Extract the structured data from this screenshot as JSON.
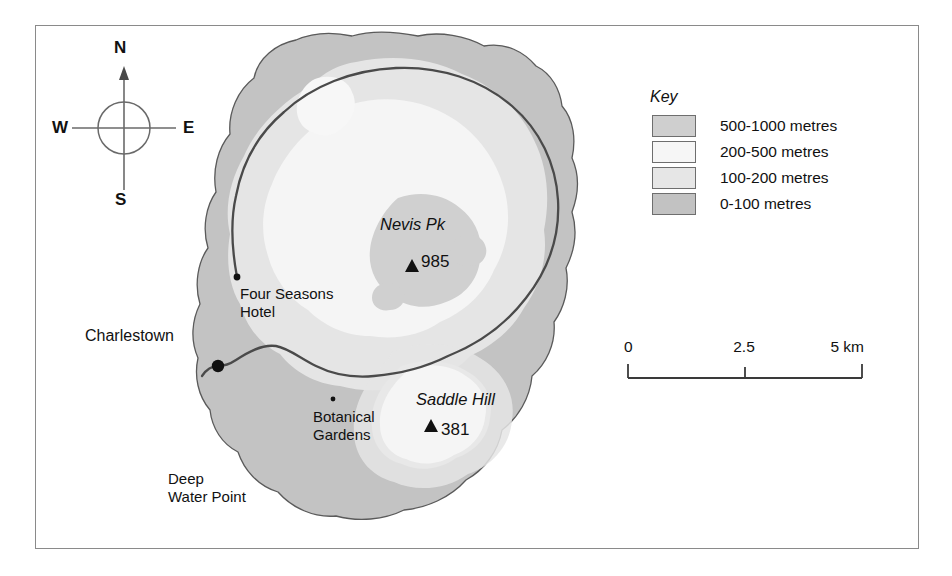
{
  "figure": {
    "kind": "physical-relief-map",
    "subject": "Nevis",
    "frame_color": "#8a8a8a",
    "background": "#ffffff"
  },
  "compass": {
    "name": "compass-rose",
    "north": "N",
    "south": "S",
    "east": "E",
    "west": "W"
  },
  "key": {
    "title": "Key",
    "entries": [
      {
        "label": "500-1000 metres",
        "color": "#cfcfcf"
      },
      {
        "label": "200-500 metres",
        "color": "#f4f4f4"
      },
      {
        "label": "100-200 metres",
        "color": "#e4e4e4"
      },
      {
        "label": "0-100 metres",
        "color": "#c2c2c2"
      }
    ]
  },
  "scale": {
    "name": "scale-bar",
    "zero": "0",
    "mid": "2.5",
    "end": "5 km",
    "unit": "km",
    "length_km": 5
  },
  "map_labels": {
    "nevis_pk": "Nevis Pk",
    "nevis_pk_height": "985",
    "saddle_hill": "Saddle Hill",
    "saddle_hill_height": "381",
    "charlestown": "Charlestown",
    "four_seasons_hotel": "Four Seasons\nHotel",
    "botanical_gardens": "Botanical\nGardens",
    "deep_water_point": "Deep\nWater Point"
  },
  "features": {
    "settlements": [
      {
        "name": "Charlestown",
        "marker": "large-dot"
      },
      {
        "name": "Four Seasons Hotel",
        "marker": "small-dot"
      },
      {
        "name": "Botanical Gardens",
        "marker": "tiny-dot"
      }
    ],
    "peaks": [
      {
        "name": "Nevis Pk",
        "height_m": 985,
        "marker": "triangle"
      },
      {
        "name": "Saddle Hill",
        "height_m": 381,
        "marker": "triangle"
      }
    ],
    "roads": [
      {
        "name": "ring road",
        "style": "solid-dark-line"
      }
    ]
  },
  "colors": {
    "band_0_100": "#c2c2c2",
    "band_100_200": "#e4e4e4",
    "band_200_500": "#f4f4f4",
    "band_500_1000": "#cfcfcf",
    "coast_outline": "#555555",
    "road": "#4a4a4a",
    "text": "#111111"
  }
}
